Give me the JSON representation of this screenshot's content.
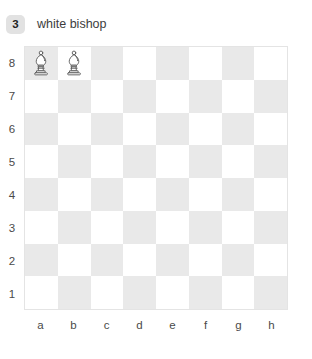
{
  "header": {
    "badge_number": "3",
    "label": "white bishop"
  },
  "colors": {
    "light_square": "#ffffff",
    "dark_square": "#e9e9e9",
    "board_border": "#e4e4e4",
    "badge_background": "#e2e2e2",
    "text": "#3d3d3d",
    "piece_fill": "#ffffff",
    "piece_stroke": "#5a5a5a"
  },
  "board": {
    "files": [
      "a",
      "b",
      "c",
      "d",
      "e",
      "f",
      "g",
      "h"
    ],
    "ranks": [
      "8",
      "7",
      "6",
      "5",
      "4",
      "3",
      "2",
      "1"
    ],
    "pieces": [
      {
        "square": "a8",
        "piece": "white-bishop",
        "file": 0,
        "rank": 0
      },
      {
        "square": "b8",
        "piece": "white-bishop",
        "file": 1,
        "rank": 0
      }
    ]
  }
}
